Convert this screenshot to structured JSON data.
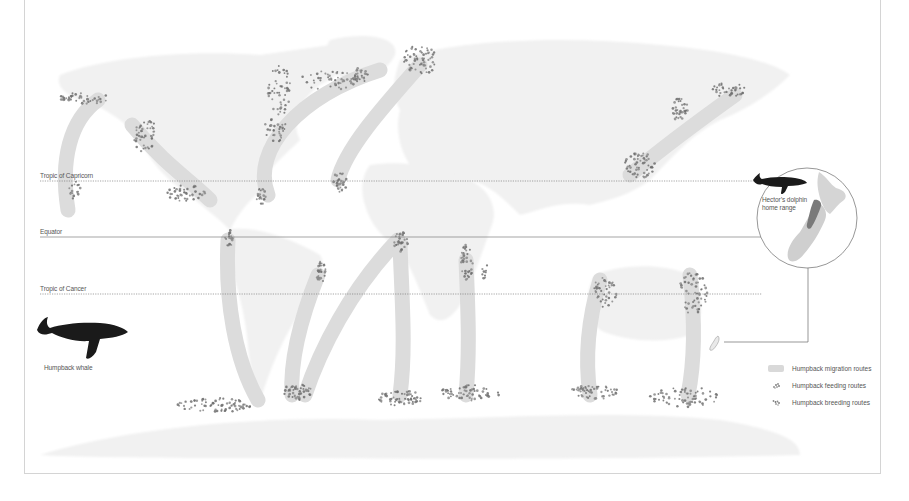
{
  "colors": {
    "land": "#f1f1f1",
    "route": "#dcdcdc",
    "dot": "#8a8a8a",
    "dot_dark": "#6e6e6e",
    "line": "#6a6a6a",
    "whale": "#1a1a1a",
    "nz_land": "#cfcfcf",
    "dolphin_range": "#7a7a7a"
  },
  "reference_lines": [
    {
      "label": "Tropic of Capricorn",
      "y": 181,
      "style": "dotted",
      "x1": 40,
      "x2": 755,
      "label_y": 172
    },
    {
      "label": "Equator",
      "y": 237,
      "style": "solid",
      "x1": 40,
      "x2": 763,
      "label_y": 228
    },
    {
      "label": "Tropic of Cancer",
      "y": 294,
      "style": "dotted",
      "x1": 40,
      "x2": 762,
      "label_y": 285
    }
  ],
  "humpback": {
    "label": "Humpback whale"
  },
  "inset": {
    "label_line1": "Hector’s dolphin",
    "label_line2": "home range",
    "cx": 807,
    "cy": 218,
    "r": 50
  },
  "legend": {
    "items": [
      {
        "label": "Humpback migration routes",
        "icon": "route-swatch"
      },
      {
        "label": "Humpback feeding routes",
        "icon": "feeding-dots"
      },
      {
        "label": "Humpback breeding routes",
        "icon": "breeding-dots"
      }
    ]
  },
  "routes": [
    {
      "name": "north-pacific-west-loop",
      "d": "M98 100 C70 120 60 160 68 210"
    },
    {
      "name": "north-pacific-east",
      "d": "M132 125 C165 165 190 180 210 200"
    },
    {
      "name": "north-atlantic-west",
      "d": "M380 70 C300 95 250 150 268 195"
    },
    {
      "name": "north-atlantic-east",
      "d": "M420 65 C380 110 345 150 338 180"
    },
    {
      "name": "north-pacific-asia",
      "d": "M735 95 C700 120 660 150 630 175"
    },
    {
      "name": "south-america-west",
      "d": "M228 240 C225 300 235 360 258 400"
    },
    {
      "name": "south-america-east",
      "d": "M318 275 C300 320 290 360 292 395"
    },
    {
      "name": "south-atlantic-diagonal",
      "d": "M398 240 C350 290 320 350 305 395"
    },
    {
      "name": "south-atlantic-africa",
      "d": "M400 245 C402 300 406 350 400 395"
    },
    {
      "name": "indian-ocean",
      "d": "M466 260 C468 310 470 350 466 395"
    },
    {
      "name": "australia-west",
      "d": "M600 280 C588 320 585 360 590 395"
    },
    {
      "name": "australia-east",
      "d": "M690 275 C695 320 695 360 688 395"
    }
  ],
  "clusters": [
    {
      "name": "alaska",
      "cx": 85,
      "cy": 98,
      "rx": 25,
      "ry": 6,
      "n": 45
    },
    {
      "name": "pacific-nw",
      "cx": 145,
      "cy": 135,
      "rx": 12,
      "ry": 18,
      "n": 45
    },
    {
      "name": "hawaii-west",
      "cx": 75,
      "cy": 190,
      "rx": 6,
      "ry": 10,
      "n": 18
    },
    {
      "name": "mexico",
      "cx": 185,
      "cy": 193,
      "rx": 20,
      "ry": 8,
      "n": 45
    },
    {
      "name": "caribbean",
      "cx": 262,
      "cy": 196,
      "rx": 6,
      "ry": 8,
      "n": 20
    },
    {
      "name": "labrador",
      "cx": 280,
      "cy": 90,
      "rx": 12,
      "ry": 25,
      "n": 50
    },
    {
      "name": "newfoundland",
      "cx": 275,
      "cy": 130,
      "rx": 14,
      "ry": 12,
      "n": 30
    },
    {
      "name": "greenland-south",
      "cx": 330,
      "cy": 80,
      "rx": 30,
      "ry": 10,
      "n": 50
    },
    {
      "name": "iceland",
      "cx": 360,
      "cy": 75,
      "rx": 8,
      "ry": 8,
      "n": 25
    },
    {
      "name": "norway",
      "cx": 420,
      "cy": 60,
      "rx": 18,
      "ry": 15,
      "n": 60
    },
    {
      "name": "cape-verde",
      "cx": 340,
      "cy": 182,
      "rx": 7,
      "ry": 10,
      "n": 30
    },
    {
      "name": "colombia",
      "cx": 229,
      "cy": 238,
      "rx": 4,
      "ry": 9,
      "n": 20
    },
    {
      "name": "brazil",
      "cx": 321,
      "cy": 272,
      "rx": 5,
      "ry": 12,
      "n": 28
    },
    {
      "name": "gulf-of-guinea",
      "cx": 401,
      "cy": 242,
      "rx": 7,
      "ry": 10,
      "n": 30
    },
    {
      "name": "madagascar",
      "cx": 467,
      "cy": 262,
      "rx": 6,
      "ry": 18,
      "n": 40
    },
    {
      "name": "mozambique",
      "cx": 485,
      "cy": 272,
      "rx": 3,
      "ry": 12,
      "n": 10
    },
    {
      "name": "kamchatka",
      "cx": 728,
      "cy": 90,
      "rx": 18,
      "ry": 7,
      "n": 35
    },
    {
      "name": "okhotsk",
      "cx": 680,
      "cy": 110,
      "rx": 8,
      "ry": 12,
      "n": 35
    },
    {
      "name": "japan",
      "cx": 640,
      "cy": 165,
      "rx": 15,
      "ry": 14,
      "n": 55
    },
    {
      "name": "west-australia",
      "cx": 605,
      "cy": 290,
      "rx": 12,
      "ry": 18,
      "n": 40
    },
    {
      "name": "east-australia",
      "cx": 693,
      "cy": 292,
      "rx": 15,
      "ry": 22,
      "n": 55
    },
    {
      "name": "antarctic-1",
      "cx": 215,
      "cy": 405,
      "rx": 38,
      "ry": 7,
      "n": 70
    },
    {
      "name": "antarctic-2",
      "cx": 297,
      "cy": 392,
      "rx": 15,
      "ry": 8,
      "n": 45
    },
    {
      "name": "antarctic-3",
      "cx": 400,
      "cy": 398,
      "rx": 22,
      "ry": 8,
      "n": 60
    },
    {
      "name": "antarctic-4",
      "cx": 470,
      "cy": 393,
      "rx": 30,
      "ry": 8,
      "n": 60
    },
    {
      "name": "antarctic-5",
      "cx": 595,
      "cy": 392,
      "rx": 25,
      "ry": 7,
      "n": 55
    },
    {
      "name": "antarctic-6",
      "cx": 685,
      "cy": 397,
      "rx": 35,
      "ry": 10,
      "n": 70
    }
  ]
}
